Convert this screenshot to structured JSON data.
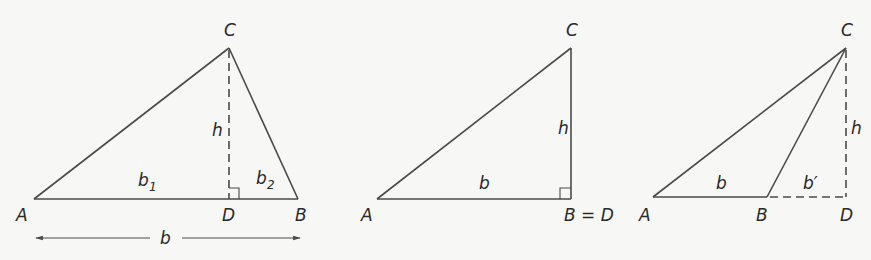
{
  "figures": [
    {
      "id": "acute-triangle",
      "vertices": {
        "A": "A",
        "B": "B",
        "C": "C",
        "D": "D"
      },
      "labels": {
        "height": "h",
        "b1": "b",
        "b1_sub": "1",
        "b2": "b",
        "b2_sub": "2",
        "base": "b"
      }
    },
    {
      "id": "right-triangle",
      "vertices": {
        "A": "A",
        "C": "C",
        "BD": "B = D"
      },
      "labels": {
        "height": "h",
        "base": "b"
      }
    },
    {
      "id": "obtuse-triangle",
      "vertices": {
        "A": "A",
        "B": "B",
        "C": "C",
        "D": "D"
      },
      "labels": {
        "height": "h",
        "base": "b",
        "extension": "b′"
      }
    }
  ],
  "colors": {
    "line": "#4a4a4a",
    "text": "#2a2a2a",
    "background": "#f7f7f5"
  }
}
